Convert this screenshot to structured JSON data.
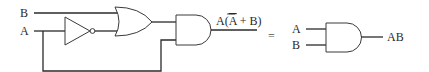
{
  "diagram": {
    "left_circuit": {
      "input_b": "B",
      "input_a": "A",
      "output_expression_prefix": "A(",
      "output_expression_abar": "A",
      "output_expression_suffix": " + B)",
      "gates": [
        "NOT",
        "OR",
        "AND"
      ]
    },
    "equals": "=",
    "right_circuit": {
      "input_a": "A",
      "input_b": "B",
      "output": "AB",
      "gates": [
        "AND"
      ]
    }
  }
}
